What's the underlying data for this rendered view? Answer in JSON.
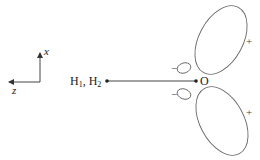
{
  "diagram": {
    "axes": {
      "vertical_label": "x",
      "horizontal_label": "z"
    },
    "atoms": {
      "hydrogens": {
        "label_1": "H",
        "sub_1": "1",
        "sep": ", ",
        "label_2": "H",
        "sub_2": "2"
      },
      "oxygen": "O"
    },
    "lobes": [
      {
        "name": "upper-large-lobe",
        "sign": "+"
      },
      {
        "name": "upper-small-lobe",
        "sign": "−"
      },
      {
        "name": "lower-small-lobe",
        "sign": "−"
      },
      {
        "name": "lower-large-lobe",
        "sign": "+"
      }
    ],
    "colors": {
      "line": "#555555",
      "text": "#222222"
    }
  }
}
